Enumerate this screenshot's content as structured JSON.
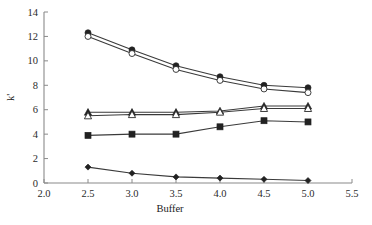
{
  "chart_data": {
    "type": "line",
    "title": "",
    "subtitle": "",
    "xlabel": "Buffer",
    "ylabel": "k'",
    "x": [
      2.5,
      3.0,
      3.5,
      4.0,
      4.5,
      5.0
    ],
    "xlim": [
      2.0,
      5.5
    ],
    "ylim": [
      0,
      14
    ],
    "xticks": [
      "2.0",
      "2.5",
      "3.0",
      "3.5",
      "4.0",
      "4.5",
      "5.0",
      "5.5"
    ],
    "xtick_values": [
      2.0,
      2.5,
      3.0,
      3.5,
      4.0,
      4.5,
      5.0,
      5.5
    ],
    "yticks": [
      "14",
      "12",
      "10",
      "8",
      "6",
      "4",
      "2",
      "0"
    ],
    "ytick_values": [
      14,
      12,
      10,
      8,
      6,
      4,
      2,
      0
    ],
    "grid": false,
    "legend": "none",
    "series": [
      {
        "name": "series-1",
        "marker": "filled-circle",
        "values": [
          12.3,
          10.9,
          9.6,
          8.7,
          8.0,
          7.8
        ]
      },
      {
        "name": "series-2",
        "marker": "open-circle",
        "values": [
          12.0,
          10.6,
          9.3,
          8.4,
          7.7,
          7.4
        ]
      },
      {
        "name": "series-3",
        "marker": "filled-triangle",
        "values": [
          5.8,
          5.8,
          5.8,
          5.9,
          6.3,
          6.3
        ]
      },
      {
        "name": "series-4",
        "marker": "open-triangle",
        "values": [
          5.5,
          5.6,
          5.6,
          5.8,
          6.1,
          6.1
        ]
      },
      {
        "name": "series-5",
        "marker": "filled-square",
        "values": [
          3.9,
          4.0,
          4.0,
          4.6,
          5.1,
          5.0
        ]
      },
      {
        "name": "series-6",
        "marker": "filled-diamond",
        "values": [
          1.3,
          0.8,
          0.5,
          0.4,
          0.3,
          0.2
        ]
      }
    ]
  }
}
